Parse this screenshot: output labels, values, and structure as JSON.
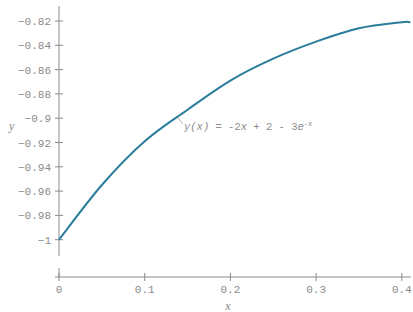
{
  "chart_data": {
    "type": "line",
    "title": "",
    "xlabel": "x",
    "ylabel": "y",
    "xlim": [
      0,
      0.41
    ],
    "ylim": [
      -1.0,
      -0.82
    ],
    "grid": false,
    "legend": null,
    "x_ticks": [
      "0",
      "0.1",
      "0.2",
      "0.3",
      "0.4"
    ],
    "y_ticks": [
      "-0.82",
      "-0.84",
      "-0.86",
      "-0.88",
      "-0.9",
      "-0.92",
      "-0.94",
      "-0.96",
      "-0.98",
      "-1"
    ],
    "series": [
      {
        "name": "y(x) = -2x + 2 - 3e^-x",
        "color": "#2a7d9a",
        "x": [
          0,
          0.05,
          0.1,
          0.15,
          0.2,
          0.25,
          0.3,
          0.35,
          0.4,
          0.41
        ],
        "y": [
          -1.0,
          -0.955,
          -0.919,
          -0.893,
          -0.869,
          -0.851,
          -0.837,
          -0.826,
          -0.821,
          -0.821
        ]
      }
    ],
    "annotations": [
      {
        "text": "y(x) = -2x + 2 - 3e^-x",
        "at_x": 0.145,
        "at_y": -0.897
      }
    ]
  },
  "labels": {
    "x_axis": "x",
    "y_axis": "y",
    "annotation_lhs": "y(x)",
    "annotation_mid": " = -2",
    "annotation_x": "x",
    "annotation_rest": " + 2 - 3",
    "annotation_e": "e",
    "annotation_sup": "-x"
  }
}
